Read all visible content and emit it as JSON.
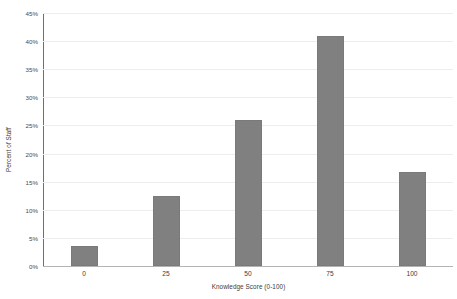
{
  "chart_data": {
    "type": "bar",
    "title": "",
    "subtitle": "",
    "xlabel": "Knowledge Score (0-100)",
    "ylabel": "Percent of Staff",
    "categories": [
      "0",
      "25",
      "50",
      "75",
      "100"
    ],
    "values": [
      3.5,
      12.5,
      26.0,
      41.0,
      16.7
    ],
    "value_unit": "%",
    "ylim": [
      0,
      45
    ],
    "ytick_step": 5,
    "ytick_labels": [
      "0%",
      "5%",
      "10%",
      "15%",
      "20%",
      "25%",
      "30%",
      "35%",
      "40%",
      "45%"
    ],
    "ytick_values": [
      0,
      5,
      10,
      15,
      20,
      25,
      30,
      35,
      40,
      45
    ],
    "xtick_labels": [
      "0",
      "25",
      "50",
      "75",
      "100"
    ],
    "grid": {
      "horizontal": true,
      "vertical": false,
      "color": "#ededed"
    },
    "legend": {
      "visible": false,
      "position": "none",
      "entries": []
    },
    "series": [
      {
        "name": "Percent of Staff",
        "values": [
          3.5,
          12.5,
          26.0,
          41.0,
          16.7
        ],
        "color": "#808080",
        "edge_color": "#7a7a7a"
      }
    ],
    "colors": {
      "bar_fill": "#808080",
      "bar_edge": "#7a7a7a",
      "gridline": "#ededed",
      "axis_line": "#6f6f6f",
      "baseline": "#b4b4b4",
      "text": "#3a3a3a",
      "background": "#ffffff"
    },
    "annotations": []
  }
}
